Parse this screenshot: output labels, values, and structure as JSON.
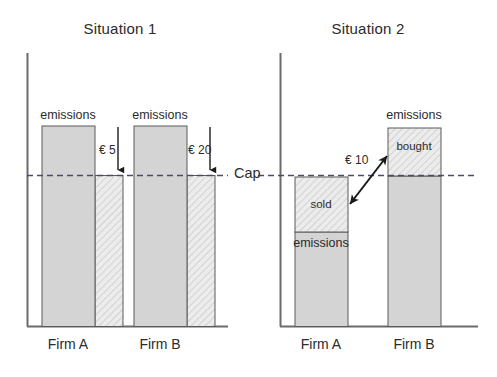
{
  "figure": {
    "width": 497,
    "height": 377,
    "background": "#ffffff",
    "cap": {
      "label": "Cap",
      "label_x": 234,
      "label_y": 166,
      "y": 175.5,
      "line_color": "#4a4a6a",
      "segments": [
        {
          "x1": 27,
          "x2": 228
        },
        {
          "x1": 258,
          "x2": 478
        }
      ]
    },
    "colors": {
      "bar_fill_solid": "#d4d4d4",
      "bar_fill_hatched": "#ececec",
      "bar_stroke": "#5a5a5a",
      "axis": "#6b6b6b",
      "text": "#2b2b2b",
      "arrow": "#1a1a1a",
      "hatch_line": "#b8b8b8"
    },
    "panels": [
      {
        "id": "situation-1",
        "title": "Situation 1",
        "title_x": 120,
        "title_y": 20,
        "axis": {
          "x": 27,
          "y_top": 53,
          "y_bottom": 326,
          "x_right": 228
        },
        "bars": [
          {
            "id": "firm-a",
            "category": "Firm A",
            "category_x": 68,
            "category_y": 335,
            "segments": [
              {
                "id": "emissions-above-cap",
                "x": 42,
                "y": 126,
                "w": 53,
                "h": 200,
                "style": "solid"
              },
              {
                "id": "allowance-shortfall",
                "x": 95,
                "y": 175.5,
                "w": 28,
                "h": 150.5,
                "style": "hatched"
              }
            ],
            "top_label": {
              "text": "emissions",
              "x": 68,
              "y": 110
            },
            "price": {
              "text": "€ 5",
              "label_x": 99,
              "label_y": 142,
              "arrow_x": 118,
              "arrow_y_top": 127,
              "arrow_y_bottom": 175
            }
          },
          {
            "id": "firm-b",
            "category": "Firm B",
            "category_x": 160,
            "category_y": 335,
            "segments": [
              {
                "id": "emissions-above-cap",
                "x": 134,
                "y": 126,
                "w": 53,
                "h": 200,
                "style": "solid"
              },
              {
                "id": "allowance-shortfall",
                "x": 187,
                "y": 175.5,
                "w": 28,
                "h": 150.5,
                "style": "hatched"
              }
            ],
            "top_label": {
              "text": "emissions",
              "x": 160,
              "y": 110
            },
            "price": {
              "text": "€ 20",
              "label_x": 188,
              "label_y": 142,
              "arrow_x": 210,
              "arrow_y_top": 127,
              "arrow_y_bottom": 175
            }
          }
        ]
      },
      {
        "id": "situation-2",
        "title": "Situation 2",
        "title_x": 368,
        "title_y": 20,
        "axis": {
          "x": 280,
          "y_top": 53,
          "y_bottom": 326,
          "x_right": 478
        },
        "bars": [
          {
            "id": "firm-a",
            "category": "Firm A",
            "category_x": 321,
            "category_y": 335,
            "segments": [
              {
                "id": "sold-allowances",
                "x": 295,
                "y": 177,
                "w": 53,
                "h": 55,
                "style": "hatched"
              },
              {
                "id": "actual-emissions",
                "x": 295,
                "y": 232,
                "w": 53,
                "h": 94,
                "style": "solid"
              }
            ],
            "inner_label": {
              "text": "sold",
              "x": 321,
              "y": 198
            },
            "below_label": {
              "text": "emissions",
              "x": 321,
              "y": 236
            }
          },
          {
            "id": "firm-b",
            "category": "Firm B",
            "category_x": 414,
            "category_y": 335,
            "segments": [
              {
                "id": "bought-allowances",
                "x": 388,
                "y": 128,
                "w": 53,
                "h": 48,
                "style": "hatched"
              },
              {
                "id": "capped-emissions",
                "x": 388,
                "y": 176,
                "w": 53,
                "h": 150,
                "style": "solid"
              }
            ],
            "inner_label": {
              "text": "bought",
              "x": 414,
              "y": 139
            },
            "top_label": {
              "text": "emissions",
              "x": 414,
              "y": 110
            }
          }
        ],
        "trade_arrow": {
          "price": "€ 10",
          "label_x": 345,
          "label_y": 153,
          "x1": 349,
          "y1": 205,
          "x2": 388,
          "y2": 155
        }
      }
    ]
  }
}
